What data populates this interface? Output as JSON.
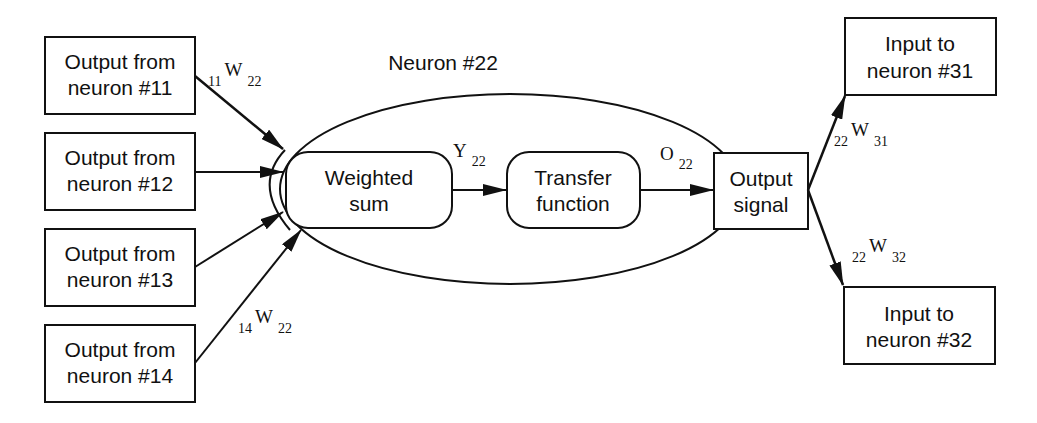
{
  "diagram": {
    "title": "Neuron #22",
    "inputs": [
      {
        "line1": "Output from",
        "line2": "neuron #11"
      },
      {
        "line1": "Output from",
        "line2": "neuron #12"
      },
      {
        "line1": "Output from",
        "line2": "neuron #13"
      },
      {
        "line1": "Output from",
        "line2": "neuron #14"
      }
    ],
    "weighted_sum": {
      "line1": "Weighted",
      "line2": "sum"
    },
    "transfer_function": {
      "line1": "Transfer",
      "line2": "function"
    },
    "output_signal": {
      "line1": "Output",
      "line2": "signal"
    },
    "outputs": [
      {
        "line1": "Input to",
        "line2": "neuron #31"
      },
      {
        "line1": "Input to",
        "line2": "neuron #32"
      }
    ],
    "labels": {
      "w11_22": {
        "pre": "11",
        "main": "W",
        "sub": "22"
      },
      "w14_22": {
        "pre": "14",
        "main": "W",
        "sub": "22"
      },
      "y22": {
        "main": "Y",
        "sub": "22"
      },
      "o22": {
        "main": "O",
        "sub": "22"
      },
      "w22_31": {
        "pre": "22",
        "main": "W",
        "sub": "31"
      },
      "w22_32": {
        "pre": "22",
        "main": "W",
        "sub": "32"
      }
    }
  }
}
